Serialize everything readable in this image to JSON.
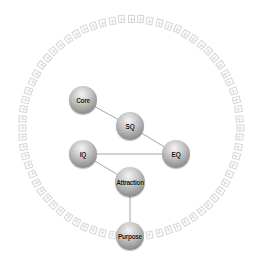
{
  "diagram": {
    "title": "",
    "ring": {
      "cx": 131,
      "cy": 128,
      "r": 109,
      "glyph_count": 72,
      "gap_start_deg": 80,
      "gap_end_deg": 100,
      "color": "#cfcfcf"
    },
    "nodes": [
      {
        "id": "core",
        "label": "Core",
        "x": 83,
        "y": 100,
        "r": 14
      },
      {
        "id": "sq",
        "label": "SQ",
        "x": 130,
        "y": 126,
        "r": 14
      },
      {
        "id": "eq",
        "label": "EQ",
        "x": 176,
        "y": 154,
        "r": 14
      },
      {
        "id": "iq",
        "label": "IQ",
        "x": 83,
        "y": 154,
        "r": 14
      },
      {
        "id": "attraction",
        "label": "Attraction",
        "x": 130,
        "y": 182,
        "r": 15
      },
      {
        "id": "purpose",
        "label": "Purpose",
        "x": 130,
        "y": 236,
        "r": 14
      }
    ],
    "edges": [
      {
        "from": "core",
        "to": "sq"
      },
      {
        "from": "sq",
        "to": "eq"
      },
      {
        "from": "iq",
        "to": "eq"
      },
      {
        "from": "iq",
        "to": "attraction"
      },
      {
        "from": "attraction",
        "to": "purpose"
      }
    ],
    "colors": {
      "node_light": "#f4f4f4",
      "node_dark": "#6a6a6a",
      "edge": "#9a9a9a",
      "ring": "#cfcfcf"
    }
  }
}
